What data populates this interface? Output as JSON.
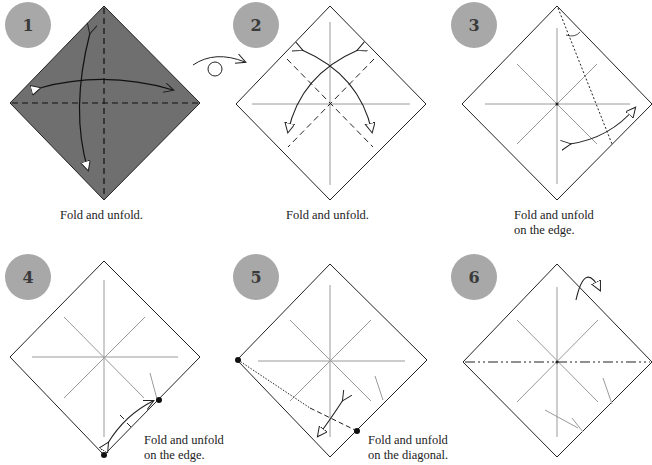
{
  "steps": [
    {
      "number": "1",
      "caption_line1": "Fold and unfold.",
      "caption_line2": ""
    },
    {
      "number": "2",
      "caption_line1": "Fold and unfold.",
      "caption_line2": ""
    },
    {
      "number": "3",
      "caption_line1": "Fold and unfold",
      "caption_line2": "on the edge."
    },
    {
      "number": "4",
      "caption_line1": "Fold and unfold",
      "caption_line2": "on the edge."
    },
    {
      "number": "5",
      "caption_line1": "Fold and unfold",
      "caption_line2": "on the diagonal."
    },
    {
      "number": "6",
      "caption_line1": "",
      "caption_line2": ""
    }
  ],
  "colors": {
    "badge": "#a8a8a8",
    "paper_colored": "#6f6f6f",
    "paper_white": "#ffffff",
    "crease": "#9a9a9a",
    "line": "#222222"
  },
  "symbols": {
    "turn_over": "turn-over-arrow"
  }
}
